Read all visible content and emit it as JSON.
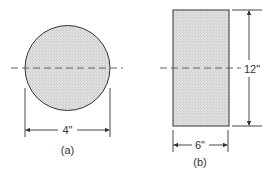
{
  "figures": [
    {
      "id": "a",
      "shape": "circle",
      "caption": "(a)",
      "dimension_label": "4\"",
      "dimension": "diameter"
    },
    {
      "id": "b",
      "shape": "rectangle",
      "caption": "(b)",
      "width_label": "6\"",
      "height_label": "12\""
    }
  ],
  "colors": {
    "fill": "#d9d9d9",
    "stroke": "#333333"
  }
}
